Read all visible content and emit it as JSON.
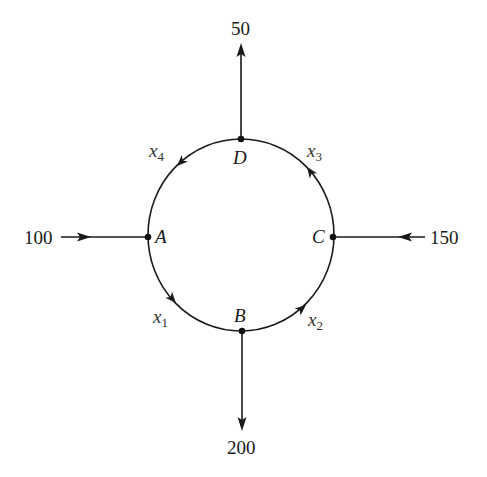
{
  "diagram": {
    "type": "traffic-flow-network",
    "nodes": [
      {
        "id": "A",
        "label": "A"
      },
      {
        "id": "B",
        "label": "B"
      },
      {
        "id": "C",
        "label": "C"
      },
      {
        "id": "D",
        "label": "D"
      }
    ],
    "external_flows": [
      {
        "node": "A",
        "direction": "in",
        "value": "100"
      },
      {
        "node": "B",
        "direction": "out",
        "value": "200"
      },
      {
        "node": "C",
        "direction": "in",
        "value": "150"
      },
      {
        "node": "D",
        "direction": "out",
        "value": "50"
      }
    ],
    "internal_flows": [
      {
        "from": "A",
        "to": "B",
        "var": "x",
        "sub": "1"
      },
      {
        "from": "B",
        "to": "C",
        "var": "x",
        "sub": "2"
      },
      {
        "from": "C",
        "to": "D",
        "var": "x",
        "sub": "3"
      },
      {
        "from": "D",
        "to": "A",
        "var": "x",
        "sub": "4"
      }
    ],
    "colors": {
      "line": "#1a1a1a",
      "background": "#ffffff"
    }
  }
}
